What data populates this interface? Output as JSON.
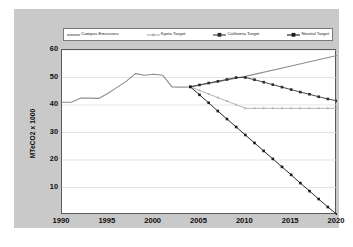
{
  "chart_data": {
    "type": "line",
    "title": "",
    "xlabel": "",
    "ylabel": "MTeCO2 x 1000",
    "xlim": [
      1990,
      2020
    ],
    "ylim": [
      0,
      60
    ],
    "xticks": [
      1990,
      1995,
      2000,
      2005,
      2010,
      2015,
      2020
    ],
    "yticks": [
      10,
      20,
      30,
      40,
      50,
      60
    ],
    "grid": "horizontal",
    "legend_position": "top",
    "series": [
      {
        "name": "Campus Emissions",
        "color": "#8c8c8c",
        "marker": "none",
        "x": [
          1990,
          1991,
          1992,
          1993,
          1994,
          1995,
          1996,
          1997,
          1998,
          1999,
          2000,
          2001,
          2002,
          2003,
          2004,
          2010,
          2015,
          2020
        ],
        "y": [
          41.0,
          41.0,
          42.5,
          42.5,
          42.4,
          44.2,
          46.4,
          48.6,
          51.4,
          50.8,
          51.2,
          50.8,
          46.6,
          46.5,
          46.6,
          50.4,
          54.2,
          58.0
        ]
      },
      {
        "name": "Kyoto Target",
        "color": "#b4b4b4",
        "marker": "square-small",
        "x": [
          2004,
          2005,
          2006,
          2007,
          2008,
          2009,
          2010,
          2011,
          2012,
          2013,
          2014,
          2015,
          2016,
          2017,
          2018,
          2019,
          2020
        ],
        "y": [
          46.6,
          45.3,
          44.0,
          42.7,
          41.4,
          40.1,
          38.8,
          38.8,
          38.8,
          38.8,
          38.8,
          38.8,
          38.8,
          38.8,
          38.8,
          38.8,
          38.8
        ]
      },
      {
        "name": "California Target",
        "color": "#4a4a4a",
        "marker": "square",
        "x": [
          2004,
          2005,
          2006,
          2007,
          2008,
          2009,
          2010,
          2011,
          2012,
          2013,
          2014,
          2015,
          2016,
          2017,
          2018,
          2019,
          2020
        ],
        "y": [
          46.6,
          47.3,
          48.0,
          48.6,
          49.3,
          50.0,
          50.0,
          49.2,
          48.3,
          47.4,
          46.5,
          45.6,
          44.7,
          43.9,
          43.0,
          42.2,
          41.5
        ]
      },
      {
        "name": "Neutral Target",
        "color": "#2b2b2b",
        "marker": "square",
        "x": [
          2004,
          2005,
          2006,
          2007,
          2008,
          2009,
          2010,
          2011,
          2012,
          2013,
          2014,
          2015,
          2016,
          2017,
          2018,
          2019,
          2020
        ],
        "y": [
          46.6,
          43.7,
          40.8,
          37.8,
          34.9,
          32.0,
          29.1,
          26.2,
          23.3,
          20.4,
          17.5,
          14.6,
          11.6,
          8.7,
          5.8,
          2.9,
          0.2
        ]
      }
    ]
  },
  "legend": {
    "items": [
      {
        "label": "Campus Emissions"
      },
      {
        "label": "Kyoto Target"
      },
      {
        "label": "California Target"
      },
      {
        "label": "Neutral Target"
      }
    ]
  },
  "axes": {
    "y_title": "MTeCO2 x 1000",
    "y_labels": [
      "60",
      "50",
      "40",
      "30",
      "20",
      "10"
    ],
    "x_labels": [
      "1990",
      "1995",
      "2000",
      "2005",
      "2010",
      "2015",
      "2020"
    ]
  }
}
